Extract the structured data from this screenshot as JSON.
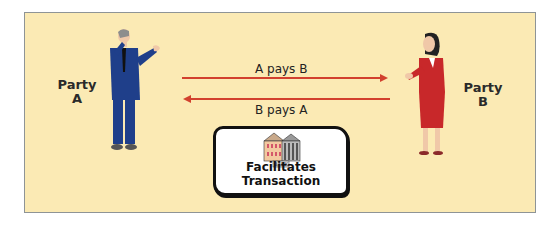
{
  "diagram": {
    "party_a": {
      "label_line1": "Party",
      "label_line2": "A"
    },
    "party_b": {
      "label_line1": "Party",
      "label_line2": "B"
    },
    "arrow_top": {
      "label": "A pays B",
      "direction": "right"
    },
    "arrow_bottom": {
      "label": "B pays A",
      "direction": "left"
    },
    "bank": {
      "sign": "BANK",
      "caption": "Facilitates Transaction"
    },
    "colors": {
      "background": "#fbeab4",
      "border": "#8e9496",
      "arrow": "#d2412e",
      "man_suit": "#1f3f8a",
      "woman_suit": "#c8282a"
    }
  }
}
